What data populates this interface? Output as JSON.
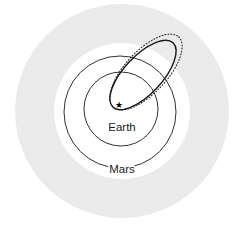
{
  "figure": {
    "title": "",
    "background_color": "#ffffff",
    "width": 244,
    "height": 227
  },
  "chart_data": {
    "type": "scatter",
    "title": "",
    "subtitle": "",
    "xlabel": "",
    "ylabel": "",
    "grid": false,
    "legend_position": "none",
    "center_marker": {
      "name": "star-marker",
      "symbol": "★",
      "label": "",
      "x": 119,
      "y": 105,
      "color": "#000000",
      "size": 9
    },
    "series": [
      {
        "name": "Earth",
        "kind": "circular-orbit",
        "label": "Earth",
        "center_x": 121,
        "center_y": 109,
        "radius": 37,
        "stroke": "#1a1a1a",
        "stroke_width": 0.9,
        "dash": "none"
      },
      {
        "name": "Mars",
        "kind": "circular-orbit",
        "label": "Mars",
        "center_x": 120,
        "center_y": 112,
        "radius": 56,
        "stroke": "#1a1a1a",
        "stroke_width": 0.9,
        "dash": "none"
      },
      {
        "name": "transfer-orbit-solid",
        "kind": "elliptical-orbit",
        "label": "",
        "center_x": 143,
        "center_y": 75,
        "semi_major": 44,
        "semi_minor": 19,
        "rotation_deg": -47,
        "stroke": "#1a1a1a",
        "stroke_width": 1.4,
        "dash": "none"
      },
      {
        "name": "transfer-orbit-dotted",
        "kind": "elliptical-orbit",
        "label": "",
        "center_x": 146,
        "center_y": 72,
        "semi_major": 48,
        "semi_minor": 21,
        "rotation_deg": -47,
        "stroke": "#1a1a1a",
        "stroke_width": 1.0,
        "dash": "1,2"
      }
    ],
    "annotations": [
      {
        "name": "earth-orbit-label",
        "text": "Earth",
        "x": 122,
        "y": 128
      },
      {
        "name": "mars-orbit-label",
        "text": "Mars",
        "x": 122,
        "y": 170
      }
    ],
    "backdrop": {
      "name": "shaded-annulus",
      "center_x": 122,
      "center_y": 111,
      "outer_radius": 107,
      "inner_radius": 68,
      "fill": "#ededed"
    }
  },
  "labels": {
    "earth": "Earth",
    "mars": "Mars"
  },
  "colors": {
    "background": "#ffffff",
    "annulus": "#ededed",
    "stroke": "#1a1a1a",
    "text": "#1a1a1a"
  }
}
